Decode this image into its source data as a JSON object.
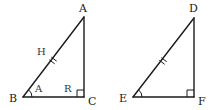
{
  "diagram": {
    "colors": {
      "stroke": "#1a1a1a",
      "background": "#ffffff",
      "label": "#1a1a1a"
    },
    "triangles": [
      {
        "name": "ABC",
        "vertices": {
          "A": {
            "label": "A",
            "x": 84,
            "y": 17
          },
          "B": {
            "label": "B",
            "x": 23,
            "y": 97
          },
          "C": {
            "label": "C",
            "x": 84,
            "y": 97
          }
        },
        "side_labels": {
          "hypotenuse": "H"
        },
        "angle_labels": {
          "at_B": "A",
          "at_C": "R"
        },
        "right_angle_at": "C",
        "hypotenuse_tick_marks": 2
      },
      {
        "name": "DEF",
        "vertices": {
          "D": {
            "label": "D",
            "x": 194,
            "y": 18
          },
          "E": {
            "label": "E",
            "x": 133,
            "y": 97
          },
          "F": {
            "label": "F",
            "x": 194,
            "y": 97
          }
        },
        "right_angle_at": "F",
        "hypotenuse_tick_marks": 2
      }
    ]
  }
}
